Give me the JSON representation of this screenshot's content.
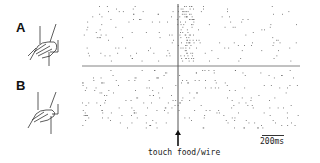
{
  "figure": {
    "panels": [
      {
        "label": "A",
        "condition": "hand grasping object (food)"
      },
      {
        "label": "B",
        "condition": "hand grasping wire"
      }
    ],
    "event_label": "touch food/wire",
    "scale_bar_label": "200ms",
    "colors": {
      "ink": "#222222",
      "axis": "#555555",
      "dot": "#666666"
    }
  },
  "chart_data": {
    "type": "scatter",
    "subtype": "spike raster",
    "title": "",
    "xlabel": "",
    "ylabel": "",
    "annotations": [
      "touch food/wire",
      "200ms"
    ],
    "event_marker": {
      "x_fraction": 0.44,
      "label": "touch food/wire"
    },
    "scale_bar": {
      "length": "200ms"
    },
    "rows": [
      {
        "panel": "A",
        "description": "upper raster: dense burst of spikes just after touch (right of event line)"
      },
      {
        "panel": "B",
        "description": "lower raster: diffuse spiking, no clear burst at touch"
      }
    ],
    "grid": false,
    "legend": null
  }
}
